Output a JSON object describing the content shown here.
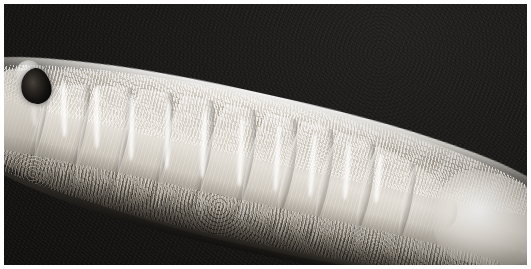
{
  "figure": {
    "kind": "scanning-electron-micrograph",
    "subject": "segmented worm-like organism",
    "orientation": "diagonal, anterior at upper-left, posterior at lower-right",
    "alt_text": "Black and white scanning electron micrograph of an elongated segmented worm-like organism lying diagonally across a dark background, showing bright transverse annulation bands along the body, a dark pigmented spot near the anterior end, and a granular textured cuticle along the upper surface.",
    "width_px": 531,
    "height_px": 269
  },
  "colors": {
    "background": "#161514",
    "frame": "#ffffff",
    "mount": "#f3f2ef",
    "body_highlight": "#efece6",
    "body_midtone": "#bdb6ab",
    "body_shadow": "#3a352f",
    "band_bright": "#ffffff",
    "head_spot": "#151311"
  },
  "anatomy": {
    "anterior_cap": "anterior-cap",
    "head_spot": "dark pigmented spot",
    "dorsal_rim": "bright illuminated dorsal margin",
    "cuticle_texture": "granular papillated cuticle",
    "ventral_shade": "shaded ventral underside",
    "tail_lobe": "smooth pale posterior lobe",
    "segment_count": 11,
    "band_count": 11
  },
  "segments": [
    {
      "left_pct": 0,
      "width_pct": 10
    },
    {
      "left_pct": 9,
      "width_pct": 10
    },
    {
      "left_pct": 18,
      "width_pct": 10
    },
    {
      "left_pct": 27,
      "width_pct": 10
    },
    {
      "left_pct": 36,
      "width_pct": 10
    },
    {
      "left_pct": 45,
      "width_pct": 10
    },
    {
      "left_pct": 54,
      "width_pct": 10
    },
    {
      "left_pct": 62,
      "width_pct": 10
    },
    {
      "left_pct": 70,
      "width_pct": 11
    },
    {
      "left_pct": 79,
      "width_pct": 11
    },
    {
      "left_pct": 88,
      "width_pct": 12
    }
  ],
  "bands": [
    {
      "left_px": 62,
      "top_px": 50,
      "width_px": 54,
      "rotate_deg": 74
    },
    {
      "left_px": 92,
      "top_px": 52,
      "width_px": 58,
      "rotate_deg": 76
    },
    {
      "left_px": 124,
      "top_px": 54,
      "width_px": 62,
      "rotate_deg": 77
    },
    {
      "left_px": 158,
      "top_px": 56,
      "width_px": 66,
      "rotate_deg": 78
    },
    {
      "left_px": 194,
      "top_px": 56,
      "width_px": 68,
      "rotate_deg": 79
    },
    {
      "left_px": 230,
      "top_px": 56,
      "width_px": 70,
      "rotate_deg": 80
    },
    {
      "left_px": 268,
      "top_px": 56,
      "width_px": 70,
      "rotate_deg": 80
    },
    {
      "left_px": 306,
      "top_px": 54,
      "width_px": 68,
      "rotate_deg": 81
    },
    {
      "left_px": 344,
      "top_px": 54,
      "width_px": 64,
      "rotate_deg": 82
    },
    {
      "left_px": 382,
      "top_px": 52,
      "width_px": 58,
      "rotate_deg": 82
    },
    {
      "left_px": 418,
      "top_px": 52,
      "width_px": 50,
      "rotate_deg": 83
    }
  ]
}
